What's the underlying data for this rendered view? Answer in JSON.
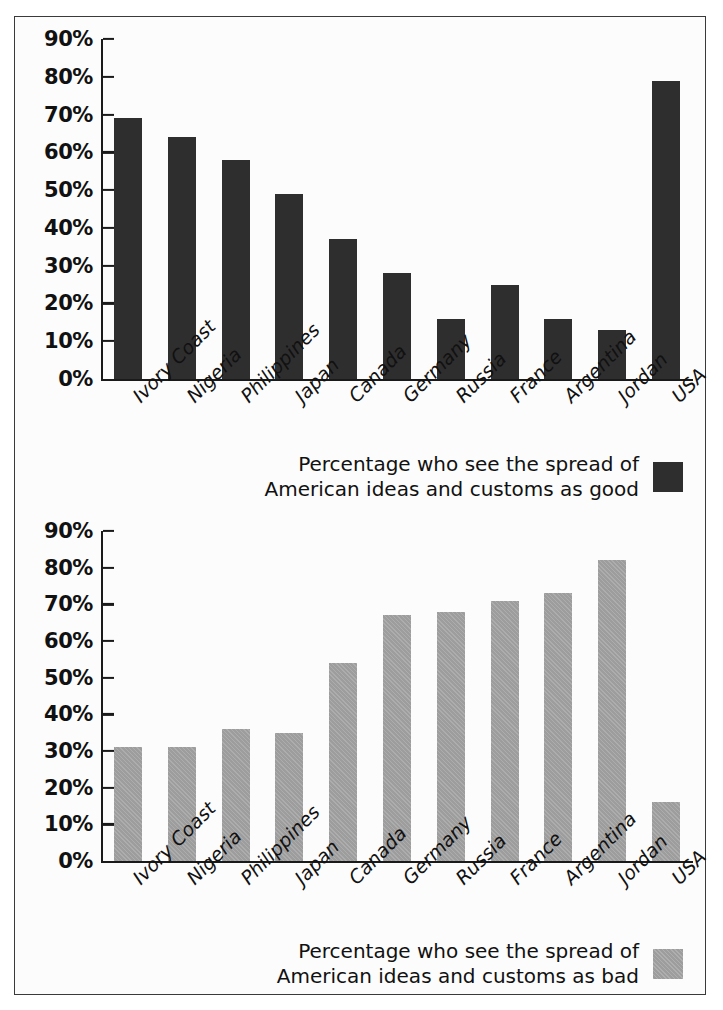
{
  "chart_data": [
    {
      "id": "good",
      "type": "bar",
      "title": "",
      "xlabel": "",
      "ylabel": "",
      "ylim": [
        0,
        90
      ],
      "ytick_values": [
        0,
        10,
        20,
        30,
        40,
        50,
        60,
        70,
        80,
        90
      ],
      "ytick_labels": [
        "0%",
        "10%",
        "20%",
        "30%",
        "40%",
        "50%",
        "60%",
        "70%",
        "80%",
        "90%"
      ],
      "grid": false,
      "legend_position": "bottom-right",
      "legend_label": "Percentage who see the spread of\nAmerican ideas and customs as good",
      "series_color": "#2e2e2e",
      "categories": [
        "Ivory Coast",
        "Nigeria",
        "Philippines",
        "Japan",
        "Canada",
        "Germany",
        "Russia",
        "France",
        "Argentina",
        "Jordan",
        "USA"
      ],
      "values": [
        69,
        64,
        58,
        49,
        37,
        28,
        16,
        25,
        16,
        13,
        79
      ]
    },
    {
      "id": "bad",
      "type": "bar",
      "title": "",
      "xlabel": "",
      "ylabel": "",
      "ylim": [
        0,
        90
      ],
      "ytick_values": [
        0,
        10,
        20,
        30,
        40,
        50,
        60,
        70,
        80,
        90
      ],
      "ytick_labels": [
        "0%",
        "10%",
        "20%",
        "30%",
        "40%",
        "50%",
        "60%",
        "70%",
        "80%",
        "90%"
      ],
      "grid": false,
      "legend_position": "bottom-right",
      "legend_label": "Percentage who see the spread of\nAmerican ideas and customs as bad",
      "series_color": "#9d9d9d",
      "categories": [
        "Ivory Coast",
        "Nigeria",
        "Philippines",
        "Japan",
        "Canada",
        "Germany",
        "Russia",
        "France",
        "Argentina",
        "Jordan",
        "USA"
      ],
      "values": [
        31,
        31,
        36,
        35,
        54,
        67,
        68,
        71,
        73,
        82,
        16
      ]
    }
  ],
  "figure": {
    "border_color": "#3a3a3a",
    "background": "#fcfcfc"
  }
}
